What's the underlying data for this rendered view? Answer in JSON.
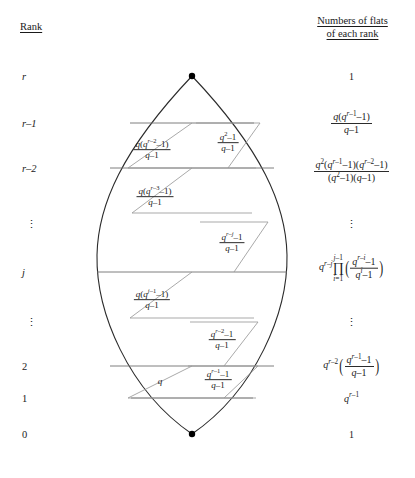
{
  "headings": {
    "rank": "Rank",
    "flats_line1": "Numbers of flats",
    "flats_line2": "of each rank"
  },
  "ranks": [
    {
      "label": "r",
      "y": 76,
      "italic": true
    },
    {
      "label": "r–1",
      "y": 123,
      "italic": true
    },
    {
      "label": "r–2",
      "y": 168,
      "italic": true
    },
    {
      "label": "⋮",
      "y": 224,
      "italic": false,
      "dots": true
    },
    {
      "label": "j",
      "y": 272,
      "italic": true
    },
    {
      "label": "⋮",
      "y": 322,
      "italic": false,
      "dots": true
    },
    {
      "label": "2",
      "y": 366,
      "italic": false
    },
    {
      "label": "1",
      "y": 398,
      "italic": false
    },
    {
      "label": "0",
      "y": 434,
      "italic": false
    }
  ],
  "flat_counts": [
    {
      "rank": "r",
      "y": 76,
      "kind": "plain",
      "text": "1"
    },
    {
      "rank": "r-1",
      "y": 123,
      "kind": "frac",
      "num": "q(q^{r-1}-1)",
      "den": "q-1"
    },
    {
      "rank": "r-2",
      "y": 171,
      "kind": "frac",
      "num": "q^2(q^{r-1}-1)(q^{r-2}-1)",
      "den": "(q^2-1)(q-1)"
    },
    {
      "rank": "dots-upper",
      "y": 224,
      "kind": "dots",
      "text": "⋮"
    },
    {
      "rank": "j",
      "y": 268,
      "kind": "product",
      "prefix": "q^{r-j}",
      "op": "∏",
      "lower": "i=1",
      "upper": "j-1",
      "num": "q^{r-i}-1",
      "den": "q^{i}-1"
    },
    {
      "rank": "dots-lower",
      "y": 322,
      "kind": "dots",
      "text": "⋮"
    },
    {
      "rank": "2",
      "y": 366,
      "kind": "paren-frac",
      "prefix": "q^{r-2}",
      "num": "q^{r-1}-1",
      "den": "q-1"
    },
    {
      "rank": "1",
      "y": 398,
      "kind": "power",
      "text": "q^{r-1}"
    },
    {
      "rank": "0",
      "y": 434,
      "kind": "plain",
      "text": "1"
    }
  ],
  "diagram": {
    "top_vertex": {
      "x": 192,
      "y": 76
    },
    "bottom_vertex": {
      "x": 192,
      "y": 434
    },
    "row_lines": [
      {
        "rank": "r-1",
        "y": 123
      },
      {
        "rank": "r-2",
        "y": 168
      },
      {
        "rank": "j",
        "y": 272
      },
      {
        "rank": "2",
        "y": 366
      },
      {
        "rank": "1",
        "y": 398
      }
    ],
    "inner_labels": [
      {
        "name": "flat-q-r-minus-2",
        "x": 152,
        "y": 150,
        "kind": "frac",
        "num": "q(q^{r-2}-1)",
        "den": "q-1"
      },
      {
        "name": "flat-q2-minus-1",
        "x": 228,
        "y": 143,
        "kind": "frac",
        "num": "q^2-1",
        "den": "q-1"
      },
      {
        "name": "flat-q-r-minus-3",
        "x": 155,
        "y": 197,
        "kind": "frac",
        "num": "q(q^{r-3}-1)",
        "den": "q-1"
      },
      {
        "name": "flat-q-r-minus-j",
        "x": 232,
        "y": 243,
        "kind": "frac",
        "num": "q^{r-j}-1",
        "den": "q-1"
      },
      {
        "name": "flat-q-j-minus-1",
        "x": 152,
        "y": 300,
        "kind": "frac",
        "num": "q(q^{j-1}-1)",
        "den": "q-1"
      },
      {
        "name": "flat-q-r-minus-2-lower",
        "x": 222,
        "y": 340,
        "kind": "frac",
        "num": "q^{r-2}-1",
        "den": "q-1"
      },
      {
        "name": "flat-q",
        "x": 160,
        "y": 381,
        "kind": "plain",
        "text": "q"
      },
      {
        "name": "flat-q-r-minus-1",
        "x": 218,
        "y": 380,
        "kind": "frac",
        "num": "q^{r-1}-1",
        "den": "q-1"
      }
    ]
  },
  "colors": {
    "stroke_outline": "#2b2b2b",
    "stroke_inner": "#8a8a8a",
    "vertex": "#000000",
    "text": "#1a1a1a"
  }
}
